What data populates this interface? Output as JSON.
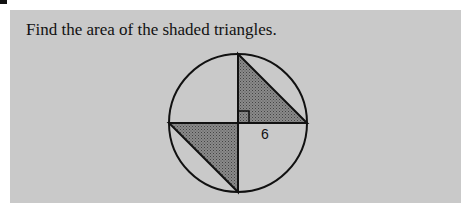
{
  "problem": {
    "prompt": "Find the area of the shaded triangles.",
    "figure": {
      "shape": "circle",
      "label": "6",
      "radius_label": "6",
      "right_angle_marker": true,
      "shaded_triangles": 2,
      "shade_color": "#7a7a7a"
    }
  }
}
